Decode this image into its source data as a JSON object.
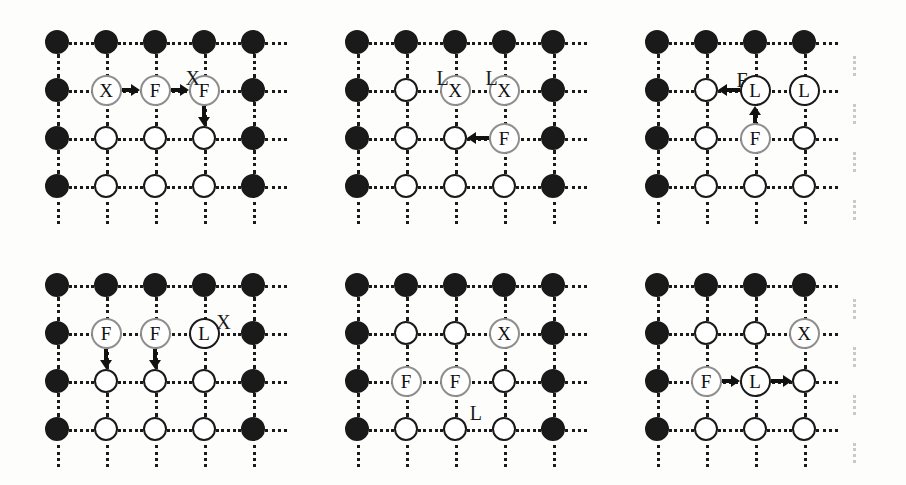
{
  "figure": {
    "title": "",
    "panel_count": 6,
    "grid": {
      "rows": 4,
      "cols": 5,
      "col_spacing_px": 49,
      "row_spacing_px": 48
    },
    "colors": {
      "filled_node": "#1a1a1a",
      "open_node_stroke": "#1a1a1a",
      "label_node_stroke": "#8e8e8e",
      "edge": "#1a1a1a",
      "faded_edge": "#dadada",
      "background": "#fdfdfb",
      "text": "#1a1a1a"
    },
    "legend": {
      "filled": "occupied / boundary site",
      "open": "empty site",
      "letters": [
        "X",
        "F",
        "L"
      ]
    }
  },
  "panels": [
    {
      "id": "panel-1",
      "name": "top-left",
      "right_column_faded": false,
      "nodes": [
        {
          "row": 1,
          "col": 1,
          "type": "filled",
          "label": ""
        },
        {
          "row": 1,
          "col": 2,
          "type": "filled",
          "label": ""
        },
        {
          "row": 1,
          "col": 3,
          "type": "filled",
          "label": ""
        },
        {
          "row": 1,
          "col": 4,
          "type": "filled",
          "label": ""
        },
        {
          "row": 1,
          "col": 5,
          "type": "filled",
          "label": ""
        },
        {
          "row": 2,
          "col": 1,
          "type": "filled",
          "label": ""
        },
        {
          "row": 2,
          "col": 2,
          "type": "label",
          "label": "X"
        },
        {
          "row": 2,
          "col": 3,
          "type": "label",
          "label": "F"
        },
        {
          "row": 2,
          "col": 4,
          "type": "label",
          "label": "F"
        },
        {
          "row": 2,
          "col": 5,
          "type": "filled",
          "label": ""
        },
        {
          "row": 3,
          "col": 1,
          "type": "filled",
          "label": ""
        },
        {
          "row": 3,
          "col": 2,
          "type": "open",
          "label": ""
        },
        {
          "row": 3,
          "col": 3,
          "type": "open",
          "label": ""
        },
        {
          "row": 3,
          "col": 4,
          "type": "open",
          "label": ""
        },
        {
          "row": 3,
          "col": 5,
          "type": "filled",
          "label": ""
        },
        {
          "row": 4,
          "col": 1,
          "type": "filled",
          "label": ""
        },
        {
          "row": 4,
          "col": 2,
          "type": "open",
          "label": ""
        },
        {
          "row": 4,
          "col": 3,
          "type": "open",
          "label": ""
        },
        {
          "row": 4,
          "col": 4,
          "type": "open",
          "label": ""
        },
        {
          "row": 4,
          "col": 5,
          "type": "filled",
          "label": ""
        }
      ],
      "arrows": [
        {
          "dir": "right",
          "row": 2,
          "col": 2
        },
        {
          "dir": "right",
          "row": 2,
          "col": 3
        },
        {
          "dir": "down",
          "row": 2,
          "col": 4
        }
      ],
      "tags": [
        {
          "text": "X",
          "row": 1.55,
          "col": 3.62
        }
      ]
    },
    {
      "id": "panel-2",
      "name": "top-middle",
      "right_column_faded": false,
      "nodes": [
        {
          "row": 1,
          "col": 1,
          "type": "filled",
          "label": ""
        },
        {
          "row": 1,
          "col": 2,
          "type": "filled",
          "label": ""
        },
        {
          "row": 1,
          "col": 3,
          "type": "filled",
          "label": ""
        },
        {
          "row": 1,
          "col": 4,
          "type": "filled",
          "label": ""
        },
        {
          "row": 1,
          "col": 5,
          "type": "filled",
          "label": ""
        },
        {
          "row": 2,
          "col": 1,
          "type": "filled",
          "label": ""
        },
        {
          "row": 2,
          "col": 2,
          "type": "open",
          "label": ""
        },
        {
          "row": 2,
          "col": 3,
          "type": "label",
          "label": "X"
        },
        {
          "row": 2,
          "col": 4,
          "type": "label",
          "label": "X"
        },
        {
          "row": 2,
          "col": 5,
          "type": "filled",
          "label": ""
        },
        {
          "row": 3,
          "col": 1,
          "type": "filled",
          "label": ""
        },
        {
          "row": 3,
          "col": 2,
          "type": "open",
          "label": ""
        },
        {
          "row": 3,
          "col": 3,
          "type": "open",
          "label": ""
        },
        {
          "row": 3,
          "col": 4,
          "type": "label",
          "label": "F"
        },
        {
          "row": 3,
          "col": 5,
          "type": "filled",
          "label": ""
        },
        {
          "row": 4,
          "col": 1,
          "type": "filled",
          "label": ""
        },
        {
          "row": 4,
          "col": 2,
          "type": "open",
          "label": ""
        },
        {
          "row": 4,
          "col": 3,
          "type": "open",
          "label": ""
        },
        {
          "row": 4,
          "col": 4,
          "type": "open",
          "label": ""
        },
        {
          "row": 4,
          "col": 5,
          "type": "filled",
          "label": ""
        }
      ],
      "arrows": [
        {
          "dir": "left",
          "row": 3,
          "col": 4
        }
      ],
      "tags": [
        {
          "text": "L",
          "row": 1.55,
          "col": 2.62
        },
        {
          "text": "L",
          "row": 1.55,
          "col": 3.62
        }
      ]
    },
    {
      "id": "panel-3",
      "name": "top-right",
      "right_column_faded": true,
      "nodes": [
        {
          "row": 1,
          "col": 1,
          "type": "filled",
          "label": ""
        },
        {
          "row": 1,
          "col": 2,
          "type": "filled",
          "label": ""
        },
        {
          "row": 1,
          "col": 3,
          "type": "filled",
          "label": ""
        },
        {
          "row": 1,
          "col": 4,
          "type": "filled",
          "label": ""
        },
        {
          "row": 2,
          "col": 1,
          "type": "filled",
          "label": ""
        },
        {
          "row": 2,
          "col": 2,
          "type": "open",
          "label": ""
        },
        {
          "row": 2,
          "col": 3,
          "type": "label-dark",
          "label": "L"
        },
        {
          "row": 2,
          "col": 4,
          "type": "label-dark",
          "label": "L"
        },
        {
          "row": 3,
          "col": 1,
          "type": "filled",
          "label": ""
        },
        {
          "row": 3,
          "col": 2,
          "type": "open",
          "label": ""
        },
        {
          "row": 3,
          "col": 3,
          "type": "label",
          "label": "F"
        },
        {
          "row": 3,
          "col": 4,
          "type": "open",
          "label": ""
        },
        {
          "row": 4,
          "col": 1,
          "type": "filled",
          "label": ""
        },
        {
          "row": 4,
          "col": 2,
          "type": "open",
          "label": ""
        },
        {
          "row": 4,
          "col": 3,
          "type": "open",
          "label": ""
        },
        {
          "row": 4,
          "col": 4,
          "type": "open",
          "label": ""
        }
      ],
      "arrows": [
        {
          "dir": "left",
          "row": 2,
          "col": 3
        },
        {
          "dir": "up",
          "row": 3,
          "col": 3
        }
      ],
      "tags": [
        {
          "text": "F",
          "row": 1.58,
          "col": 2.62
        }
      ]
    },
    {
      "id": "panel-4",
      "name": "bottom-left",
      "right_column_faded": false,
      "nodes": [
        {
          "row": 1,
          "col": 1,
          "type": "filled",
          "label": ""
        },
        {
          "row": 1,
          "col": 2,
          "type": "filled",
          "label": ""
        },
        {
          "row": 1,
          "col": 3,
          "type": "filled",
          "label": ""
        },
        {
          "row": 1,
          "col": 4,
          "type": "filled",
          "label": ""
        },
        {
          "row": 1,
          "col": 5,
          "type": "filled",
          "label": ""
        },
        {
          "row": 2,
          "col": 1,
          "type": "filled",
          "label": ""
        },
        {
          "row": 2,
          "col": 2,
          "type": "label",
          "label": "F"
        },
        {
          "row": 2,
          "col": 3,
          "type": "label",
          "label": "F"
        },
        {
          "row": 2,
          "col": 4,
          "type": "label-dark",
          "label": "L"
        },
        {
          "row": 2,
          "col": 5,
          "type": "filled",
          "label": ""
        },
        {
          "row": 3,
          "col": 1,
          "type": "filled",
          "label": ""
        },
        {
          "row": 3,
          "col": 2,
          "type": "open",
          "label": ""
        },
        {
          "row": 3,
          "col": 3,
          "type": "open",
          "label": ""
        },
        {
          "row": 3,
          "col": 4,
          "type": "open",
          "label": ""
        },
        {
          "row": 3,
          "col": 5,
          "type": "filled",
          "label": ""
        },
        {
          "row": 4,
          "col": 1,
          "type": "filled",
          "label": ""
        },
        {
          "row": 4,
          "col": 2,
          "type": "open",
          "label": ""
        },
        {
          "row": 4,
          "col": 3,
          "type": "open",
          "label": ""
        },
        {
          "row": 4,
          "col": 4,
          "type": "open",
          "label": ""
        },
        {
          "row": 4,
          "col": 5,
          "type": "filled",
          "label": ""
        }
      ],
      "arrows": [
        {
          "dir": "down",
          "row": 2,
          "col": 2
        },
        {
          "dir": "down",
          "row": 2,
          "col": 3
        }
      ],
      "tags": [
        {
          "text": "X",
          "row": 1.56,
          "col": 4.25
        }
      ]
    },
    {
      "id": "panel-5",
      "name": "bottom-middle",
      "right_column_faded": false,
      "nodes": [
        {
          "row": 1,
          "col": 1,
          "type": "filled",
          "label": ""
        },
        {
          "row": 1,
          "col": 2,
          "type": "filled",
          "label": ""
        },
        {
          "row": 1,
          "col": 3,
          "type": "filled",
          "label": ""
        },
        {
          "row": 1,
          "col": 4,
          "type": "filled",
          "label": ""
        },
        {
          "row": 1,
          "col": 5,
          "type": "filled",
          "label": ""
        },
        {
          "row": 2,
          "col": 1,
          "type": "filled",
          "label": ""
        },
        {
          "row": 2,
          "col": 2,
          "type": "open",
          "label": ""
        },
        {
          "row": 2,
          "col": 3,
          "type": "open",
          "label": ""
        },
        {
          "row": 2,
          "col": 4,
          "type": "label",
          "label": "X"
        },
        {
          "row": 2,
          "col": 5,
          "type": "filled",
          "label": ""
        },
        {
          "row": 3,
          "col": 1,
          "type": "filled",
          "label": ""
        },
        {
          "row": 3,
          "col": 2,
          "type": "label",
          "label": "F"
        },
        {
          "row": 3,
          "col": 3,
          "type": "label",
          "label": "F"
        },
        {
          "row": 3,
          "col": 4,
          "type": "open",
          "label": ""
        },
        {
          "row": 3,
          "col": 5,
          "type": "filled",
          "label": ""
        },
        {
          "row": 4,
          "col": 1,
          "type": "filled",
          "label": ""
        },
        {
          "row": 4,
          "col": 2,
          "type": "open",
          "label": ""
        },
        {
          "row": 4,
          "col": 3,
          "type": "open",
          "label": ""
        },
        {
          "row": 4,
          "col": 4,
          "type": "open",
          "label": ""
        },
        {
          "row": 4,
          "col": 5,
          "type": "filled",
          "label": ""
        }
      ],
      "arrows": [],
      "tags": [
        {
          "text": "L",
          "row": 3.45,
          "col": 3.3
        }
      ]
    },
    {
      "id": "panel-6",
      "name": "bottom-right",
      "right_column_faded": true,
      "nodes": [
        {
          "row": 1,
          "col": 1,
          "type": "filled",
          "label": ""
        },
        {
          "row": 1,
          "col": 2,
          "type": "filled",
          "label": ""
        },
        {
          "row": 1,
          "col": 3,
          "type": "filled",
          "label": ""
        },
        {
          "row": 1,
          "col": 4,
          "type": "filled",
          "label": ""
        },
        {
          "row": 2,
          "col": 1,
          "type": "filled",
          "label": ""
        },
        {
          "row": 2,
          "col": 2,
          "type": "open",
          "label": ""
        },
        {
          "row": 2,
          "col": 3,
          "type": "open",
          "label": ""
        },
        {
          "row": 2,
          "col": 4,
          "type": "label",
          "label": "X"
        },
        {
          "row": 3,
          "col": 1,
          "type": "filled",
          "label": ""
        },
        {
          "row": 3,
          "col": 2,
          "type": "label",
          "label": "F"
        },
        {
          "row": 3,
          "col": 3,
          "type": "label-dark",
          "label": "L"
        },
        {
          "row": 3,
          "col": 4,
          "type": "open",
          "label": ""
        },
        {
          "row": 4,
          "col": 1,
          "type": "filled",
          "label": ""
        },
        {
          "row": 4,
          "col": 2,
          "type": "open",
          "label": ""
        },
        {
          "row": 4,
          "col": 3,
          "type": "open",
          "label": ""
        },
        {
          "row": 4,
          "col": 4,
          "type": "open",
          "label": ""
        }
      ],
      "arrows": [
        {
          "dir": "right",
          "row": 3,
          "col": 2
        },
        {
          "dir": "right",
          "row": 3,
          "col": 3
        }
      ],
      "tags": []
    }
  ]
}
